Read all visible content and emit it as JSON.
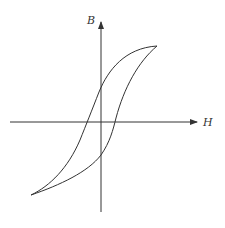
{
  "diagram": {
    "axes": {
      "x_label": "H",
      "y_label": "B"
    },
    "colors": {
      "line": "#333333",
      "background": "#ffffff"
    },
    "key_points": {
      "positive_saturation": [
        157,
        46
      ],
      "negative_saturation": [
        31,
        195
      ],
      "origin": [
        101,
        122
      ]
    }
  }
}
